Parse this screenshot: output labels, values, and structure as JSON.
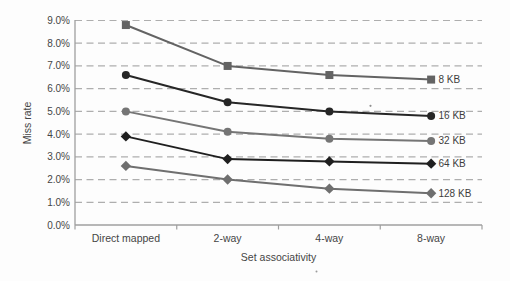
{
  "chart_data": {
    "type": "line",
    "title": "",
    "xlabel": "Set associativity",
    "ylabel": "Miss rate",
    "categories": [
      "Direct mapped",
      "2-way",
      "4-way",
      "8-way"
    ],
    "series": [
      {
        "name": "8 KB",
        "marker": "square",
        "color": "#636363",
        "values": [
          8.8,
          7.0,
          6.6,
          6.4
        ]
      },
      {
        "name": "16 KB",
        "marker": "circle",
        "color": "#262626",
        "values": [
          6.6,
          5.4,
          5.0,
          4.8
        ]
      },
      {
        "name": "32 KB",
        "marker": "circle",
        "color": "#757575",
        "values": [
          5.0,
          4.1,
          3.8,
          3.7
        ]
      },
      {
        "name": "64 KB",
        "marker": "diamond",
        "color": "#1f1f1f",
        "values": [
          3.9,
          2.9,
          2.8,
          2.7
        ]
      },
      {
        "name": "128 KB",
        "marker": "diamond",
        "color": "#6f6f6f",
        "values": [
          2.6,
          2.0,
          1.6,
          1.4
        ]
      }
    ],
    "ylim": [
      0,
      9
    ],
    "ytick_step": 1,
    "ytick_labels": [
      "0.0%",
      "1.0%",
      "2.0%",
      "3.0%",
      "4.0%",
      "5.0%",
      "6.0%",
      "7.0%",
      "8.0%",
      "9.0%"
    ],
    "grid": "dashed-horizontal",
    "legend_position": "right-of-line-ends",
    "colors": {
      "grid": "#aeaeae",
      "axis": "#9f9f9f",
      "text": "#454545",
      "background": "#fdfdfd"
    }
  }
}
